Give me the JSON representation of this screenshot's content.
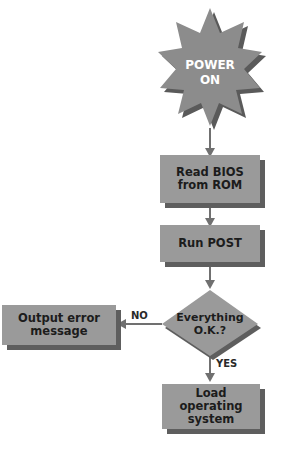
{
  "diagram": {
    "type": "flowchart",
    "nodes": {
      "start": {
        "shape": "starburst",
        "text_line1": "POWER",
        "text_line2": "ON"
      },
      "read_bios": {
        "shape": "box",
        "text_line1": "Read BIOS",
        "text_line2": "from ROM"
      },
      "run_post": {
        "shape": "box",
        "text": "Run POST"
      },
      "decision": {
        "shape": "diamond",
        "text_line1": "Everything",
        "text_line2": "O.K.?"
      },
      "error": {
        "shape": "box",
        "text_line1": "Output error",
        "text_line2": "message"
      },
      "load_os": {
        "shape": "box",
        "text_line1": "Load operating",
        "text_line2": "system"
      }
    },
    "edges": {
      "no_label": "NO",
      "yes_label": "YES"
    },
    "colors": {
      "box_fill": "#9a9a9a",
      "box_shadow": "#5e5e5e",
      "arrow": "#707070",
      "text": "#1c1c1c",
      "start_text": "#ffffff"
    }
  }
}
